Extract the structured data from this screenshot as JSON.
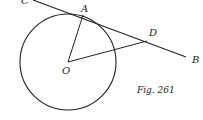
{
  "figure": {
    "caption": "Fig. 261",
    "labels": {
      "C": "C",
      "A": "A",
      "D": "D",
      "B": "B",
      "O": "O"
    },
    "circle": {
      "cx": 68,
      "cy": 62,
      "r": 48
    },
    "points": {
      "C": [
        33,
        0
      ],
      "A": [
        83,
        15
      ],
      "D": [
        147,
        41
      ],
      "B": [
        186,
        57
      ],
      "O": [
        68,
        62
      ]
    },
    "stroke_color": "#222222"
  }
}
